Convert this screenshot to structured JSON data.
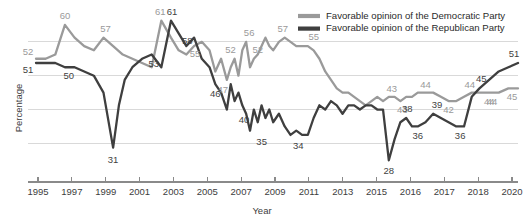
{
  "chart_data": {
    "type": "line",
    "title": "",
    "xlabel": "Year",
    "ylabel": "Percentage",
    "xlim": [
      1995,
      2020
    ],
    "ylim": [
      25,
      64
    ],
    "grid": true,
    "gridlines_y": [
      32,
      40,
      48,
      56
    ],
    "legend_position": "top-right",
    "x_tick_values": [
      1995,
      1997,
      1999,
      2001,
      2003,
      2005,
      2007,
      2009,
      2011,
      2013,
      2015,
      2016,
      2017,
      2018,
      2020
    ],
    "x_tick_labels": [
      "1995",
      "1997",
      "1999",
      "2001",
      "2003",
      "2005",
      "2007",
      "2009",
      "2011",
      "2013",
      "2015",
      "2016",
      "2017",
      "2018",
      "2020"
    ],
    "y_tick_labels": [],
    "series": [
      {
        "name": "Favorable opinion of the Democratic Party",
        "color": "#9a9a9a",
        "x": [
          1995.0,
          1995.5,
          1996.0,
          1996.5,
          1997.0,
          1997.5,
          1998.0,
          1998.5,
          1999.0,
          1999.5,
          2000.0,
          2000.5,
          2001.0,
          2001.5,
          2002.0,
          2002.4,
          2002.8,
          2003.2,
          2003.6,
          2004.0,
          2004.3,
          2004.6,
          2004.9,
          2005.1,
          2005.3,
          2005.5,
          2005.7,
          2005.9,
          2006.1,
          2006.3,
          2006.5,
          2006.7,
          2006.9,
          2007.1,
          2007.3,
          2007.6,
          2007.9,
          2008.2,
          2008.5,
          2008.8,
          2009.1,
          2009.4,
          2009.7,
          2010.0,
          2010.3,
          2010.6,
          2010.9,
          2011.2,
          2011.5,
          2011.8,
          2012.1,
          2012.4,
          2012.7,
          2013.0,
          2013.3,
          2013.6,
          2013.9,
          2014.2,
          2014.5,
          2014.8,
          2015.2,
          2015.6,
          2016.0,
          2016.4,
          2016.8,
          2017.2,
          2017.6,
          2018.0,
          2018.5,
          2019.0,
          2019.5,
          2020.0
        ],
        "y": [
          52,
          52,
          53,
          60,
          57,
          55,
          54,
          57,
          55,
          53,
          52,
          51,
          50,
          61,
          57,
          54,
          53,
          55,
          56,
          54,
          49,
          52,
          47,
          50,
          52,
          48,
          54,
          56,
          50,
          52,
          53,
          55,
          57,
          55,
          54,
          56,
          57,
          56,
          55,
          55,
          55,
          54,
          52,
          49,
          47,
          45,
          44,
          44,
          43,
          42,
          41,
          42,
          43,
          42,
          43,
          43,
          42,
          43,
          43,
          44,
          44,
          44,
          43,
          42,
          42,
          43,
          44,
          44,
          44,
          44,
          45,
          45
        ]
      },
      {
        "name": "Favorable opinion of the Republican Party",
        "color": "#3f3f3f",
        "x": [
          1995.0,
          1995.5,
          1996.0,
          1996.5,
          1997.0,
          1997.5,
          1998.0,
          1998.5,
          1999.0,
          1999.3,
          1999.6,
          2000.0,
          2000.5,
          2001.0,
          2001.5,
          2002.0,
          2002.4,
          2002.8,
          2003.2,
          2003.6,
          2004.0,
          2004.3,
          2004.6,
          2004.9,
          2005.1,
          2005.3,
          2005.5,
          2005.7,
          2005.9,
          2006.1,
          2006.3,
          2006.5,
          2006.7,
          2006.9,
          2007.1,
          2007.3,
          2007.6,
          2007.9,
          2008.2,
          2008.5,
          2008.8,
          2009.1,
          2009.4,
          2009.7,
          2010.0,
          2010.3,
          2010.6,
          2010.9,
          2011.2,
          2011.5,
          2011.8,
          2012.1,
          2012.4,
          2012.7,
          2013.0,
          2013.3,
          2013.6,
          2013.9,
          2014.2,
          2014.5,
          2014.8,
          2015.2,
          2015.6,
          2016.0,
          2016.4,
          2016.8,
          2017.2,
          2017.6,
          2018.0,
          2018.5,
          2019.0,
          2019.5,
          2020.0
        ],
        "y": [
          51,
          51,
          51,
          50,
          50,
          49,
          48,
          44,
          31,
          41,
          47,
          50,
          52,
          53,
          50,
          61,
          58,
          55,
          57,
          52,
          50,
          46,
          44,
          40,
          46,
          42,
          44,
          41,
          39,
          35,
          40,
          37,
          41,
          38,
          40,
          37,
          39,
          36,
          34,
          35,
          34,
          34,
          38,
          41,
          40,
          42,
          41,
          39,
          41,
          41,
          40,
          41,
          41,
          40,
          40,
          28,
          33,
          37,
          38,
          36,
          36,
          37,
          39,
          38,
          37,
          36,
          36,
          43,
          45,
          47,
          49,
          50,
          51
        ]
      }
    ],
    "point_labels": [
      {
        "text": "52",
        "x": 1995.0,
        "y": 52,
        "series": "democratic",
        "dx": -8,
        "dy": -4
      },
      {
        "text": "60",
        "x": 1996.5,
        "y": 60,
        "series": "democratic",
        "dx": 0,
        "dy": -6
      },
      {
        "text": "57",
        "x": 1998.5,
        "y": 57,
        "series": "democratic",
        "dx": 2,
        "dy": -6
      },
      {
        "text": "61",
        "x": 2001.5,
        "y": 61,
        "series": "democratic",
        "dx": -1,
        "dy": -6
      },
      {
        "text": "55",
        "x": 2003.4,
        "y": 55,
        "series": "democratic",
        "dx": -3,
        "dy": 11
      },
      {
        "text": "47",
        "x": 2004.9,
        "y": 47,
        "series": "democratic",
        "dx": -4,
        "dy": 13
      },
      {
        "text": "52",
        "x": 2005.3,
        "y": 52,
        "series": "democratic",
        "dx": -4,
        "dy": -6
      },
      {
        "text": "56",
        "x": 2005.9,
        "y": 56,
        "series": "democratic",
        "dx": 3,
        "dy": -6
      },
      {
        "text": "52",
        "x": 2006.3,
        "y": 52,
        "series": "democratic",
        "dx": 4,
        "dy": -6
      },
      {
        "text": "57",
        "x": 2007.9,
        "y": 57,
        "series": "democratic",
        "dx": -2,
        "dy": -6
      },
      {
        "text": "55",
        "x": 2009.1,
        "y": 55,
        "series": "democratic",
        "dx": 6,
        "dy": -6
      },
      {
        "text": "43",
        "x": 2013.3,
        "y": 43,
        "series": "democratic",
        "dx": 3,
        "dy": -5
      },
      {
        "text": "43",
        "x": 2013.9,
        "y": 42,
        "series": "democratic",
        "dx": 2,
        "dy": 12
      },
      {
        "text": "44",
        "x": 2015.2,
        "y": 44,
        "series": "democratic",
        "dx": 0,
        "dy": -5
      },
      {
        "text": "42",
        "x": 2016.4,
        "y": 42,
        "series": "democratic",
        "dx": 0,
        "dy": 12
      },
      {
        "text": "44",
        "x": 2017.6,
        "y": 44,
        "series": "democratic",
        "dx": -2,
        "dy": -5
      },
      {
        "text": "44",
        "x": 2018.5,
        "y": 44,
        "series": "democratic",
        "dx": 3,
        "dy": 12
      },
      {
        "text": "45",
        "x": 2020.0,
        "y": 45,
        "series": "democratic",
        "dx": -6,
        "dy": 12
      },
      {
        "text": "51",
        "x": 1995.0,
        "y": 51,
        "series": "republican",
        "dx": -8,
        "dy": 10
      },
      {
        "text": "50",
        "x": 1996.8,
        "y": 50,
        "series": "republican",
        "dx": -2,
        "dy": 12
      },
      {
        "text": "31",
        "x": 1999.0,
        "y": 31,
        "series": "republican",
        "dx": 0,
        "dy": 15
      },
      {
        "text": "53",
        "x": 2001.0,
        "y": 53,
        "series": "republican",
        "dx": 2,
        "dy": 12
      },
      {
        "text": "61",
        "x": 2002.0,
        "y": 61,
        "series": "republican",
        "dx": 1,
        "dy": -6
      },
      {
        "text": "58",
        "x": 2002.8,
        "y": 58,
        "series": "republican",
        "dx": 1,
        "dy": 11
      },
      {
        "text": "46",
        "x": 2004.4,
        "y": 46,
        "series": "republican",
        "dx": -2,
        "dy": 13
      },
      {
        "text": "40",
        "x": 2006.1,
        "y": 40,
        "series": "republican",
        "dx": -6,
        "dy": 13
      },
      {
        "text": "35",
        "x": 2006.6,
        "y": 35,
        "series": "republican",
        "dx": 2,
        "dy": 14
      },
      {
        "text": "34",
        "x": 2008.6,
        "y": 34,
        "series": "republican",
        "dx": 0,
        "dy": 14
      },
      {
        "text": "28",
        "x": 2013.3,
        "y": 28,
        "series": "republican",
        "dx": 0,
        "dy": 14
      },
      {
        "text": "38",
        "x": 2014.2,
        "y": 38,
        "series": "republican",
        "dx": 1,
        "dy": -6
      },
      {
        "text": "36",
        "x": 2014.8,
        "y": 36,
        "series": "republican",
        "dx": 0,
        "dy": 13
      },
      {
        "text": "39",
        "x": 2015.8,
        "y": 39,
        "series": "republican",
        "dx": 0,
        "dy": -6
      },
      {
        "text": "36",
        "x": 2017.0,
        "y": 36,
        "series": "republican",
        "dx": 0,
        "dy": 13
      },
      {
        "text": "45",
        "x": 2018.3,
        "y": 45,
        "series": "republican",
        "dx": -4,
        "dy": -6
      },
      {
        "text": "44",
        "x": 2018.3,
        "y": 44,
        "series": "democratic",
        "dx": 4,
        "dy": 12
      },
      {
        "text": "51",
        "x": 2020.0,
        "y": 51,
        "series": "republican",
        "dx": -4,
        "dy": -6
      }
    ]
  },
  "legend": {
    "items": [
      {
        "label": "Favorable opinion of the Democratic Party",
        "color": "#9a9a9a"
      },
      {
        "label": "Favorable opinion of the Republican Party",
        "color": "#3f3f3f"
      }
    ]
  },
  "axes": {
    "x_title": "Year",
    "y_title": "Percentage"
  },
  "colors": {
    "democratic": "#9a9a9a",
    "republican": "#3f3f3f",
    "grid": "#d9d9d9",
    "axis": "#8a8a8a",
    "text": "#3d3d3d",
    "background": "#ffffff"
  }
}
